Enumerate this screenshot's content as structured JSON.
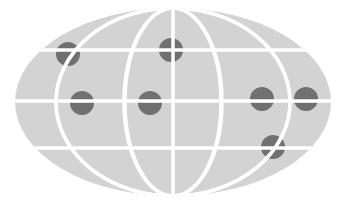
{
  "title": "Globe map with location markers",
  "colors": {
    "background": "#ffffff",
    "globe_fill": "#d3d3d3",
    "grid_lines": "#ffffff",
    "marker": "#707070"
  },
  "globe": {
    "cx": 173,
    "cy": 102,
    "rx": 158,
    "ry": 94
  },
  "parallels_y": [
    50,
    101,
    148
  ],
  "meridians": [
    {
      "name": "meridian-outer-left",
      "x_equator": 56
    },
    {
      "name": "meridian-inner-left",
      "x_equator": 125
    },
    {
      "name": "meridian-center",
      "x_equator": 173
    },
    {
      "name": "meridian-inner-right",
      "x_equator": 222
    },
    {
      "name": "meridian-outer-right",
      "x_equator": 290
    }
  ],
  "markers": [
    {
      "x": 68,
      "y": 54,
      "r": 12
    },
    {
      "x": 171,
      "y": 50,
      "r": 12
    },
    {
      "x": 82,
      "y": 103,
      "r": 12
    },
    {
      "x": 150,
      "y": 103,
      "r": 12
    },
    {
      "x": 262,
      "y": 99,
      "r": 12
    },
    {
      "x": 306,
      "y": 99,
      "r": 12
    },
    {
      "x": 273,
      "y": 147,
      "r": 12
    }
  ]
}
